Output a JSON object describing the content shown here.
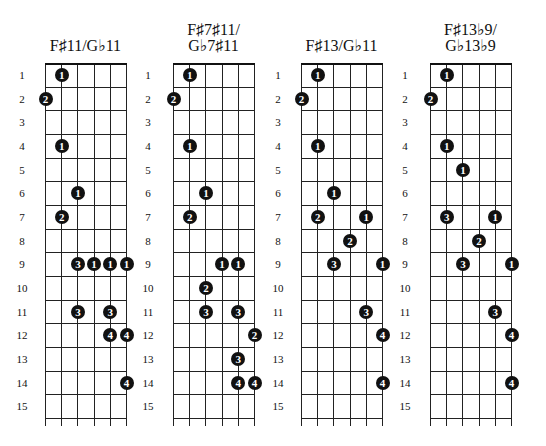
{
  "layout": {
    "fret_top": 63,
    "fret_spacing": 23.67,
    "num_frets": 15,
    "num_strings": 6,
    "string_spacing": 16.2,
    "tail": 8
  },
  "charts": [
    {
      "title_lines": [
        "F♯11/G♭11"
      ],
      "title_top": 38,
      "grid_left": 45,
      "labels_x": 22,
      "fret_labels": [
        "1",
        "2",
        "3",
        "4",
        "5",
        "6",
        "7",
        "8",
        "9",
        "10",
        "11",
        "12",
        "13",
        "14",
        "15"
      ],
      "dots": [
        {
          "fret": 1,
          "string": 2,
          "finger": "1"
        },
        {
          "fret": 2,
          "string": 1,
          "finger": "2"
        },
        {
          "fret": 4,
          "string": 2,
          "finger": "1"
        },
        {
          "fret": 6,
          "string": 3,
          "finger": "1"
        },
        {
          "fret": 7,
          "string": 2,
          "finger": "2"
        },
        {
          "fret": 9,
          "string": 3,
          "finger": "3"
        },
        {
          "fret": 9,
          "string": 4,
          "finger": "1"
        },
        {
          "fret": 9,
          "string": 5,
          "finger": "1"
        },
        {
          "fret": 9,
          "string": 6,
          "finger": "1"
        },
        {
          "fret": 11,
          "string": 3,
          "finger": "3"
        },
        {
          "fret": 11,
          "string": 5,
          "finger": "3"
        },
        {
          "fret": 12,
          "string": 5,
          "finger": "4"
        },
        {
          "fret": 12,
          "string": 6,
          "finger": "4"
        },
        {
          "fret": 14,
          "string": 6,
          "finger": "4"
        }
      ]
    },
    {
      "title_lines": [
        "F♯7♯11/",
        "G♭7♯11"
      ],
      "title_top": 22,
      "grid_left": 173,
      "labels_x": 148,
      "fret_labels": [
        "1",
        "2",
        "3",
        "4",
        "5",
        "6",
        "7",
        "8",
        "9",
        "10",
        "11",
        "12",
        "13",
        "14",
        "15"
      ],
      "dots": [
        {
          "fret": 1,
          "string": 2,
          "finger": "1"
        },
        {
          "fret": 2,
          "string": 1,
          "finger": "2"
        },
        {
          "fret": 4,
          "string": 2,
          "finger": "1"
        },
        {
          "fret": 6,
          "string": 3,
          "finger": "1"
        },
        {
          "fret": 7,
          "string": 2,
          "finger": "2"
        },
        {
          "fret": 9,
          "string": 4,
          "finger": "1"
        },
        {
          "fret": 9,
          "string": 5,
          "finger": "1"
        },
        {
          "fret": 10,
          "string": 3,
          "finger": "2"
        },
        {
          "fret": 11,
          "string": 3,
          "finger": "3"
        },
        {
          "fret": 11,
          "string": 5,
          "finger": "3"
        },
        {
          "fret": 12,
          "string": 6,
          "finger": "2"
        },
        {
          "fret": 13,
          "string": 5,
          "finger": "3"
        },
        {
          "fret": 14,
          "string": 5,
          "finger": "4"
        },
        {
          "fret": 14,
          "string": 6,
          "finger": "4"
        }
      ]
    },
    {
      "title_lines": [
        "F♯13/G♭11"
      ],
      "title_top": 38,
      "grid_left": 301,
      "labels_x": 278,
      "fret_labels": [
        "1",
        "2",
        "3",
        "4",
        "5",
        "6",
        "7",
        "8",
        "9",
        "10",
        "11",
        "12",
        "13",
        "14",
        "15"
      ],
      "dots": [
        {
          "fret": 1,
          "string": 2,
          "finger": "1"
        },
        {
          "fret": 2,
          "string": 1,
          "finger": "2"
        },
        {
          "fret": 4,
          "string": 2,
          "finger": "1"
        },
        {
          "fret": 6,
          "string": 3,
          "finger": "1"
        },
        {
          "fret": 7,
          "string": 2,
          "finger": "2"
        },
        {
          "fret": 7,
          "string": 5,
          "finger": "1"
        },
        {
          "fret": 8,
          "string": 4,
          "finger": "2"
        },
        {
          "fret": 9,
          "string": 3,
          "finger": "3"
        },
        {
          "fret": 9,
          "string": 6,
          "finger": "1"
        },
        {
          "fret": 11,
          "string": 5,
          "finger": "3"
        },
        {
          "fret": 12,
          "string": 6,
          "finger": "4"
        },
        {
          "fret": 14,
          "string": 6,
          "finger": "4"
        }
      ]
    },
    {
      "title_lines": [
        "F♯13♭9/",
        "G♭13♭9"
      ],
      "title_top": 22,
      "grid_left": 430,
      "labels_x": 405,
      "fret_labels": [
        "1",
        "2",
        "3",
        "4",
        "5",
        "6",
        "7",
        "8",
        "9",
        "10",
        "11",
        "12",
        "13",
        "14",
        "15"
      ],
      "dots": [
        {
          "fret": 1,
          "string": 2,
          "finger": "1"
        },
        {
          "fret": 2,
          "string": 1,
          "finger": "2"
        },
        {
          "fret": 4,
          "string": 2,
          "finger": "1"
        },
        {
          "fret": 5,
          "string": 3,
          "finger": "1"
        },
        {
          "fret": 7,
          "string": 2,
          "finger": "3"
        },
        {
          "fret": 7,
          "string": 5,
          "finger": "1"
        },
        {
          "fret": 8,
          "string": 4,
          "finger": "2"
        },
        {
          "fret": 9,
          "string": 3,
          "finger": "3"
        },
        {
          "fret": 9,
          "string": 6,
          "finger": "1"
        },
        {
          "fret": 11,
          "string": 5,
          "finger": "3"
        },
        {
          "fret": 12,
          "string": 6,
          "finger": "4"
        },
        {
          "fret": 14,
          "string": 6,
          "finger": "4"
        }
      ]
    }
  ]
}
